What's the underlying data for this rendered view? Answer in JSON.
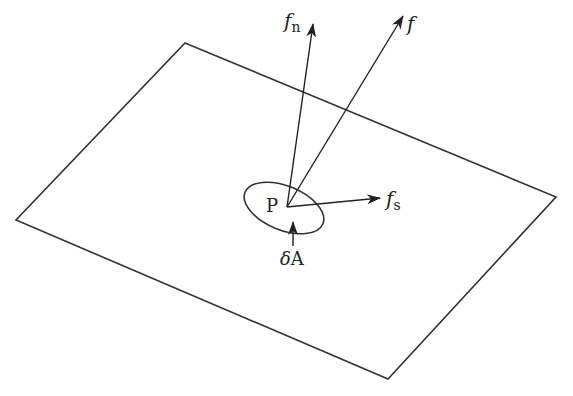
{
  "diagram": {
    "plane": {
      "corners": [
        [
          185,
          43
        ],
        [
          556,
          197
        ],
        [
          388,
          379
        ],
        [
          16,
          220
        ]
      ],
      "stroke": "#333333"
    },
    "point": {
      "label": "P",
      "x": 287,
      "y": 207
    },
    "area_element": {
      "label_prefix": "δ",
      "label_main": "A",
      "ellipse": {
        "cx": 284,
        "cy": 208,
        "rx": 42,
        "ry": 22,
        "rotate": 22
      }
    },
    "vectors": [
      {
        "id": "f_n",
        "base": "f",
        "sub": "n",
        "tip": [
          313,
          24
        ]
      },
      {
        "id": "f",
        "base": "f",
        "sub": "",
        "tip": [
          403,
          16
        ]
      },
      {
        "id": "f_s",
        "base": "f",
        "sub": "s",
        "tip": [
          380,
          198
        ]
      }
    ],
    "labels": {
      "fn_base": "f",
      "fn_sub": "n",
      "f": "f",
      "fs_base": "f",
      "fs_sub": "s",
      "P": "P",
      "dA_delta": "δ",
      "dA_A": "A"
    }
  }
}
